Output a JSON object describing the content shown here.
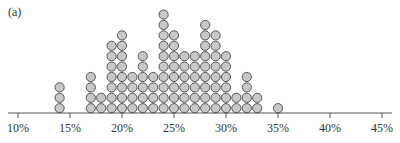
{
  "panel_label": "(a)",
  "chart_data": {
    "type": "dot",
    "title": "",
    "panel": "(a)",
    "xlabel": "",
    "ylabel": "",
    "x_unit": "%",
    "xlim": [
      9,
      46
    ],
    "x_ticks": [
      10,
      15,
      20,
      25,
      30,
      35,
      40,
      45
    ],
    "x_tick_labels": [
      "10%",
      "15%",
      "20%",
      "25%",
      "30%",
      "35%",
      "40%",
      "45%"
    ],
    "grid": false,
    "legend": null,
    "x": [
      14,
      17,
      18,
      19,
      20,
      21,
      22,
      23,
      24,
      25,
      26,
      27,
      28,
      29,
      30,
      31,
      32,
      33,
      35
    ],
    "counts": [
      3,
      4,
      2,
      7,
      8,
      4,
      6,
      4,
      10,
      8,
      6,
      6,
      9,
      8,
      6,
      2,
      4,
      2,
      1
    ],
    "dot_fill": "#c8c8c8",
    "dot_stroke": "#555555",
    "axis_color": "#555555"
  }
}
